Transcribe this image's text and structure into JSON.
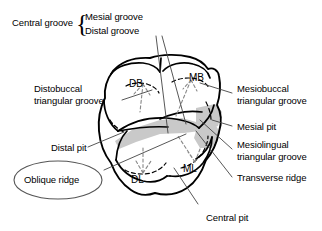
{
  "figure": {
    "background_color": "#ffffff",
    "line_color": "#000000",
    "shade_color": "#c9c9c9"
  },
  "labels": {
    "central_groove": "Central groove",
    "mesial_groove": "Mesial groove",
    "distal_groove": "Distal groove",
    "distobuccal_triangular_groove": "Distobuccal\ntriangular groove",
    "mesiobuccal_triangular_groove": "Mesiobuccal\ntriangular groove",
    "mesial_pit": "Mesial pit",
    "mesiolingual_triangular_groove": "Mesiolingual\ntriangular groove",
    "transverse_ridge": "Transverse ridge",
    "distal_pit": "Distal pit",
    "oblique_ridge": "Oblique ridge",
    "central_pit": "Central pit",
    "brace_glyph": "{"
  },
  "cusps": {
    "distobuccal": "DB",
    "mesiobuccal": "MB",
    "distolingual": "DL",
    "mesiolingual": "ML"
  }
}
